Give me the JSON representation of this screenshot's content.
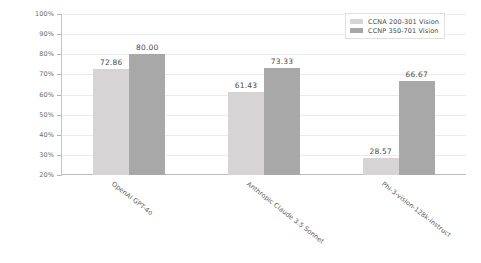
{
  "chart_data": {
    "type": "bar",
    "title": "",
    "xlabel": "",
    "ylabel": "Accuracy (%)",
    "ylim": [
      20,
      100
    ],
    "yticks": [
      "20%",
      "30%",
      "40%",
      "50%",
      "60%",
      "70%",
      "80%",
      "90%",
      "100%"
    ],
    "grid": true,
    "legend_position": "top-right",
    "categories": [
      "OpenAI GPT-4o",
      "Anthropic Claude 3.5 Sonnet",
      "Phi-3-vision-128k-instruct"
    ],
    "series": [
      {
        "name": "CCNA 200-301 Vision",
        "color": "#d6d4d4",
        "values": [
          72.86,
          61.43,
          28.57
        ],
        "labels": [
          "72.86",
          "61.43",
          "28.57"
        ]
      },
      {
        "name": "CCNP 350-701 Vision",
        "color": "#a9a8a8",
        "values": [
          80.0,
          73.33,
          66.67
        ],
        "labels": [
          "80.00",
          "73.33",
          "66.67"
        ]
      }
    ]
  },
  "legend": {
    "entries": [
      {
        "label": "CCNA 200-301 Vision"
      },
      {
        "label": "CCNP 350-701 Vision"
      }
    ]
  }
}
